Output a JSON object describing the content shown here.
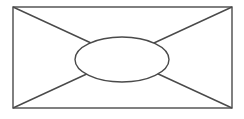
{
  "canvas": {
    "width": 244,
    "height": 119,
    "background_color": "#ffffff"
  },
  "diagram": {
    "stroke_color": "#4a4a4a",
    "stroke_width": 1.4,
    "rectangle": {
      "x": 13,
      "y": 7,
      "width": 219,
      "height": 101,
      "fill": "none"
    },
    "diagonal_tl_br": {
      "x1": 13,
      "y1": 7,
      "x2": 232,
      "y2": 108
    },
    "diagonal_tr_bl": {
      "x1": 232,
      "y1": 7,
      "x2": 13,
      "y2": 108
    },
    "ellipse": {
      "cx": 122,
      "cy": 59.5,
      "rx": 47,
      "ry": 22.5,
      "fill": "#ffffff"
    }
  }
}
